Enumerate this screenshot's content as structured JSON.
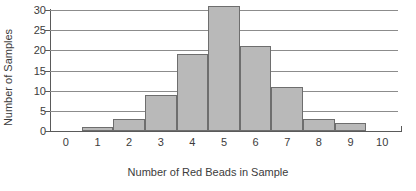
{
  "chart_data": {
    "type": "bar",
    "title": "",
    "xlabel": "Number of Red Beads in Sample",
    "ylabel": "Number of Samples",
    "categories": [
      "0",
      "1",
      "2",
      "3",
      "4",
      "5",
      "6",
      "7",
      "8",
      "9",
      "10"
    ],
    "values": [
      0,
      1,
      3,
      9,
      19,
      31,
      21,
      11,
      3,
      2,
      0
    ],
    "xlim": [
      -0.5,
      10.5
    ],
    "ylim": [
      0,
      30
    ],
    "ytick_values": [
      0,
      5,
      10,
      15,
      20,
      25,
      30
    ],
    "ytick_labels": [
      "0",
      "5",
      "10",
      "15",
      "20",
      "25",
      "30"
    ],
    "xtick_labels": [
      "0",
      "1",
      "2",
      "3",
      "4",
      "5",
      "6",
      "7",
      "8",
      "9",
      "10"
    ],
    "grid": "horizontal",
    "legend": "none",
    "bar_fill_color": "#b9b9b9",
    "bar_edge_color": "#6e6e6e",
    "axis_color": "#5a5a5a",
    "grid_color": "#8c8c8c",
    "text_color": "#3c3c3c",
    "background_color": "#ffffff"
  }
}
